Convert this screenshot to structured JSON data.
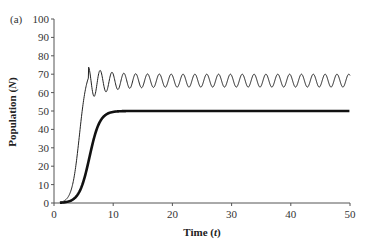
{
  "chart_data": {
    "type": "line",
    "panel_label": "(a)",
    "title": "",
    "xlabel": "Time (t)",
    "ylabel": "Population (N)",
    "xlim": [
      0,
      50
    ],
    "ylim": [
      0,
      100
    ],
    "xticks": [
      0,
      10,
      20,
      30,
      40,
      50
    ],
    "yticks": [
      0,
      10,
      20,
      30,
      40,
      50,
      60,
      70,
      80,
      90,
      100
    ],
    "grid": false,
    "legend": null,
    "series": [
      {
        "name": "oscillating (thin line)",
        "style": "thin",
        "description": "Overshoots to ~74 at t≈6, damped oscillation then sustained oscillation between ~63 and ~70 with period ≈2",
        "x": [
          1,
          2,
          3,
          4,
          5,
          6,
          7,
          8,
          9,
          10,
          12,
          14,
          16,
          18,
          20,
          25,
          30,
          35,
          40,
          45,
          50
        ],
        "values": [
          1,
          3,
          10,
          30,
          55,
          74,
          57,
          73,
          59,
          72,
          71,
          70,
          70,
          70,
          70,
          70,
          70,
          70,
          70,
          70,
          70
        ],
        "oscillation": {
          "upper": 70,
          "lower": 63,
          "period": 2,
          "start_t": 5.8
        }
      },
      {
        "name": "logistic (thick line)",
        "style": "thick",
        "description": "Sigmoid rise reaching carrying capacity 50 at t≈9, flat thereafter",
        "x": [
          1,
          2,
          3,
          4,
          5,
          6,
          7,
          8,
          9,
          10,
          20,
          30,
          40,
          50
        ],
        "values": [
          1,
          2,
          4,
          9,
          17,
          28,
          39,
          47,
          50,
          50,
          50,
          50,
          50,
          50
        ]
      }
    ]
  }
}
